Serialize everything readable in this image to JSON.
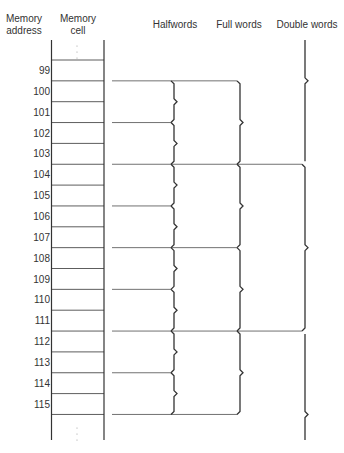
{
  "headers": {
    "address": "Memory address",
    "address_l1": "Memory",
    "address_l2": "address",
    "cell_l1": "Memory",
    "cell_l2": "cell",
    "halfwords": "Halfwords",
    "fullwords": "Full words",
    "doublewords": "Double words"
  },
  "addresses": [
    "99",
    "100",
    "101",
    "102",
    "103",
    "104",
    "105",
    "106",
    "107",
    "108",
    "109",
    "110",
    "111",
    "112",
    "113",
    "114",
    "115"
  ],
  "colors": {
    "line": "#333333"
  }
}
